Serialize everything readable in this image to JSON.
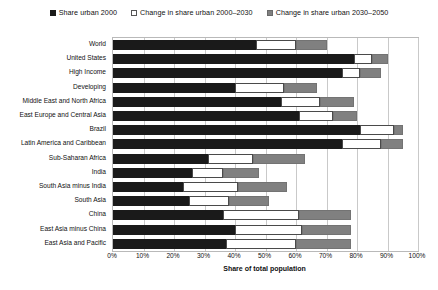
{
  "chart_data": {
    "type": "bar",
    "orientation": "horizontal",
    "stacked": true,
    "title": "",
    "xlabel": "Share of total population",
    "ylabel": "",
    "xlim": [
      0,
      100
    ],
    "xticks": [
      "0%",
      "10%",
      "20%",
      "30%",
      "40%",
      "50%",
      "60%",
      "70%",
      "80%",
      "90%",
      "100%"
    ],
    "xtick_values": [
      0,
      10,
      20,
      30,
      40,
      50,
      60,
      70,
      80,
      90,
      100
    ],
    "grid": true,
    "legend_position": "top-center",
    "categories": [
      "World",
      "United States",
      "High Income",
      "Developing",
      "Middle East and North Africa",
      "East Europe and Central Asia",
      "Brazil",
      "Latin America and Caribbean",
      "Sub-Saharan Africa",
      "India",
      "South Asia minus India",
      "South Asia",
      "China",
      "East Asia minus China",
      "East Asia and Pacific"
    ],
    "series": [
      {
        "name": "Share urban 2000",
        "color": "#1a1a1a",
        "values": [
          47,
          79,
          75,
          40,
          55,
          61,
          81,
          75,
          31,
          26,
          23,
          25,
          36,
          40,
          37
        ]
      },
      {
        "name": "Change in share urban 2000-2030",
        "color": "#ffffff",
        "values": [
          13,
          6,
          6,
          16,
          13,
          11,
          11,
          13,
          15,
          10,
          18,
          13,
          25,
          22,
          23
        ]
      },
      {
        "name": "Change in share urban 2030-2050",
        "color": "#808080",
        "values": [
          10,
          5,
          7,
          11,
          11,
          8,
          3,
          7,
          17,
          12,
          16,
          13,
          17,
          16,
          18
        ]
      }
    ],
    "totals": [
      70,
      90,
      88,
      67,
      79,
      80,
      95,
      95,
      63,
      48,
      57,
      51,
      78,
      78,
      78
    ]
  },
  "legend": {
    "items": [
      {
        "label": "Share urban 2000",
        "swatch": "filled-black-square-icon"
      },
      {
        "label": "Change in share urban 2000–2030",
        "swatch": "hollow-white-square-icon"
      },
      {
        "label": "Change in share urban 2030–2050",
        "swatch": "filled-gray-square-icon"
      }
    ]
  },
  "caption": {
    "sliver": ""
  }
}
